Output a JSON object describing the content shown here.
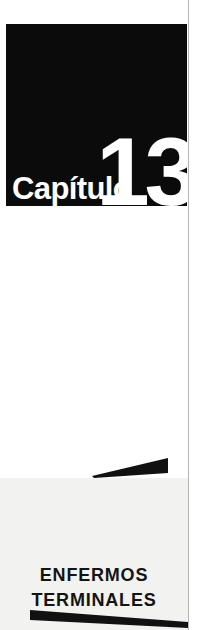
{
  "page": {
    "kind": "book-chapter-opening-page",
    "background_color": "#ffffff"
  },
  "chapter_plate": {
    "background_color": "#0b0b0b",
    "text_color": "#ffffff",
    "word_label": "Capítulo",
    "number_label": "13"
  },
  "lower_panel": {
    "background_color": "#f2f2f0"
  },
  "chapter_title": {
    "color": "#141414",
    "line1": "ENFERMOS",
    "line2": "TERMINALES"
  },
  "decorations": {
    "wedge_color": "#111111",
    "rule_color": "#b4b4b4",
    "top_wedge_name": "wedge-pointing-left",
    "bottom_wedge_name": "wedge-pointing-right"
  }
}
